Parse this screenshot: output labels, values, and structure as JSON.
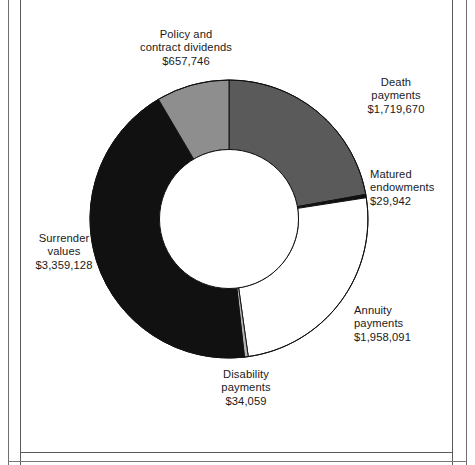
{
  "figure": {
    "background_color": "#ffffff",
    "border_color": "#5a5a5a"
  },
  "chart_data": {
    "type": "pie",
    "variant": "donut",
    "title": "",
    "subtitle": "",
    "xlabel": "",
    "ylabel": "",
    "legend_position": "none",
    "grid": false,
    "value_prefix": "$",
    "total": 7758636,
    "start_angle_deg": 0,
    "direction": "clockwise",
    "inner_radius_ratio": 0.5,
    "categories": [
      "Death payments",
      "Matured endowments",
      "Annuity payments",
      "Disability payments",
      "Surrender values",
      "Policy and contract dividends"
    ],
    "values": [
      1719670,
      29942,
      1958091,
      34059,
      3359128,
      657746
    ],
    "value_labels": [
      "$1,719,670",
      "$29,942",
      "$1,958,091",
      "$34,059",
      "$3,359,128",
      "$657,746"
    ],
    "colors": [
      "#5a5a5a",
      "#111111",
      "#ffffff",
      "#b4b4b4",
      "#111111",
      "#8e8e8e"
    ],
    "slices": [
      {
        "name": "death-payments",
        "label_lines": [
          "Death",
          "payments",
          "$1,719,670"
        ],
        "value": 1719670,
        "value_label": "$1,719,670",
        "percent": 22.2,
        "angle_deg": 79.8,
        "color": "#5a5a5a"
      },
      {
        "name": "matured-endowments",
        "label_lines": [
          "Matured",
          "endowments",
          "$29,942"
        ],
        "value": 29942,
        "value_label": "$29,942",
        "percent": 0.4,
        "angle_deg": 1.4,
        "color": "#111111"
      },
      {
        "name": "annuity-payments",
        "label_lines": [
          "Annuity",
          "payments",
          "$1,958,091"
        ],
        "value": 1958091,
        "value_label": "$1,958,091",
        "percent": 25.2,
        "angle_deg": 90.9,
        "color": "#ffffff"
      },
      {
        "name": "disability-payments",
        "label_lines": [
          "Disability",
          "payments",
          "$34,059"
        ],
        "value": 34059,
        "value_label": "$34,059",
        "percent": 0.4,
        "angle_deg": 1.6,
        "color": "#b4b4b4"
      },
      {
        "name": "surrender-values",
        "label_lines": [
          "Surrender",
          "values",
          "$3,359,128"
        ],
        "value": 3359128,
        "value_label": "$3,359,128",
        "percent": 43.3,
        "angle_deg": 155.9,
        "color": "#111111"
      },
      {
        "name": "policy-contract-dividends",
        "label_lines": [
          "Policy and",
          "contract dividends",
          "$657,746"
        ],
        "value": 657746,
        "value_label": "$657,746",
        "percent": 8.5,
        "angle_deg": 30.5,
        "color": "#8e8e8e"
      }
    ]
  },
  "labels": {
    "policy": {
      "l1": "Policy and",
      "l2": "contract dividends",
      "l3": "$657,746"
    },
    "death": {
      "l1": "Death",
      "l2": "payments",
      "l3": "$1,719,670"
    },
    "matured": {
      "l1": "Matured",
      "l2": "endowments",
      "l3": "$29,942"
    },
    "annuity": {
      "l1": "Annuity",
      "l2": "payments",
      "l3": "$1,958,091"
    },
    "disability": {
      "l1": "Disability",
      "l2": "payments",
      "l3": "$34,059"
    },
    "surrender": {
      "l1": "Surrender",
      "l2": "values",
      "l3": "$3,359,128"
    }
  }
}
